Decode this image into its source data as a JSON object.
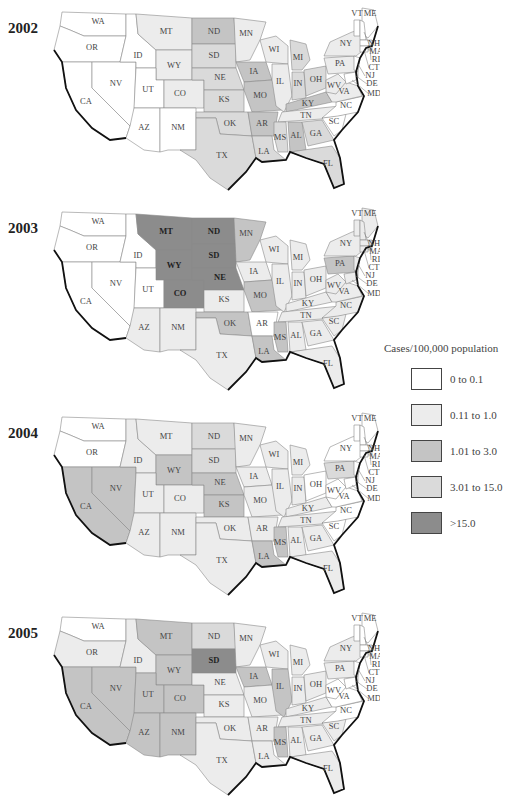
{
  "legend": {
    "title": "Cases/100,000 population",
    "items": [
      {
        "label": "0 to 0.1",
        "color": "#ffffff"
      },
      {
        "label": "0.11 to 1.0",
        "color": "#ececec"
      },
      {
        "label": "1.01  to 3.0",
        "color": "#c4c4c4"
      },
      {
        "label": "3.01 to 15.0",
        "color": "#dadada"
      },
      {
        "label": ">15.0",
        "color": "#8c8c8c"
      }
    ]
  },
  "chart_data": {
    "type": "choropleth",
    "title": "",
    "measure": "Cases/100,000 population",
    "categories": [
      "0 to 0.1",
      "0.11 to 1.0",
      "1.01 to 3.0",
      "3.01 to 15.0",
      ">15.0"
    ],
    "years": [
      {
        "year": "2002",
        "states": {
          "WA": 0,
          "OR": 0,
          "CA": 0,
          "NV": 0,
          "ID": 0,
          "UT": 0,
          "AZ": 0,
          "NM": 0,
          "MT": 1,
          "WY": 1,
          "CO": 1,
          "ND": 2,
          "SD": 3,
          "NE": 3,
          "KS": 3,
          "OK": 3,
          "TX": 3,
          "MN": 1,
          "IA": 2,
          "MO": 2,
          "AR": 2,
          "LA": 3,
          "WI": 1,
          "IL": 1,
          "MI": 3,
          "IN": 3,
          "OH": 3,
          "KY": 2,
          "TN": 1,
          "MS": 3,
          "AL": 2,
          "GA": 3,
          "FL": 3,
          "SC": 0,
          "NC": 0,
          "WV": 1,
          "VA": 1,
          "PA": 1,
          "NY": 1,
          "VT": 0,
          "ME": 0,
          "NH": 0,
          "MA": 0,
          "RI": 0,
          "CT": 0,
          "NJ": 0,
          "DE": 0,
          "MD": 0
        }
      },
      {
        "year": "2003",
        "states": {
          "WA": 0,
          "OR": 0,
          "CA": 0,
          "NV": 0,
          "ID": 0,
          "UT": 0,
          "AZ": 1,
          "NM": 1,
          "MT": 4,
          "WY": 4,
          "CO": 4,
          "ND": 4,
          "SD": 4,
          "NE": 4,
          "KS": 1,
          "OK": 2,
          "TX": 1,
          "MN": 2,
          "IA": 1,
          "MO": 2,
          "AR": 0,
          "LA": 2,
          "WI": 1,
          "IL": 1,
          "MI": 1,
          "IN": 1,
          "OH": 1,
          "KY": 1,
          "TN": 1,
          "MS": 2,
          "AL": 1,
          "GA": 1,
          "FL": 1,
          "SC": 1,
          "NC": 1,
          "WV": 1,
          "VA": 1,
          "PA": 2,
          "NY": 1,
          "VT": 1,
          "ME": 1,
          "NH": 1,
          "MA": 1,
          "RI": 1,
          "CT": 1,
          "NJ": 1,
          "DE": 2,
          "MD": 1
        }
      },
      {
        "year": "2004",
        "states": {
          "WA": 0,
          "OR": 0,
          "CA": 2,
          "NV": 2,
          "ID": 1,
          "UT": 1,
          "AZ": 1,
          "NM": 1,
          "MT": 1,
          "WY": 2,
          "CO": 1,
          "ND": 3,
          "SD": 3,
          "NE": 2,
          "KS": 2,
          "OK": 1,
          "TX": 1,
          "MN": 1,
          "IA": 1,
          "MO": 1,
          "AR": 1,
          "LA": 2,
          "WI": 1,
          "IL": 1,
          "MI": 1,
          "IN": 1,
          "OH": 0,
          "KY": 1,
          "TN": 1,
          "MS": 2,
          "AL": 1,
          "GA": 1,
          "FL": 1,
          "SC": 0,
          "NC": 0,
          "WV": 0,
          "VA": 0,
          "PA": 3,
          "NY": 0,
          "VT": 0,
          "ME": 0,
          "NH": 0,
          "MA": 0,
          "RI": 0,
          "CT": 0,
          "NJ": 0,
          "DE": 0,
          "MD": 0
        }
      },
      {
        "year": "2005",
        "states": {
          "WA": 0,
          "OR": 1,
          "CA": 2,
          "NV": 2,
          "ID": 1,
          "UT": 2,
          "AZ": 2,
          "NM": 2,
          "MT": 2,
          "WY": 2,
          "CO": 2,
          "ND": 3,
          "SD": 4,
          "NE": 1,
          "KS": 1,
          "OK": 1,
          "TX": 1,
          "MN": 1,
          "IA": 2,
          "MO": 1,
          "AR": 1,
          "LA": 1,
          "WI": 1,
          "IL": 2,
          "MI": 1,
          "IN": 1,
          "OH": 1,
          "KY": 1,
          "TN": 1,
          "MS": 2,
          "AL": 1,
          "GA": 1,
          "FL": 1,
          "SC": 1,
          "NC": 0,
          "WV": 0,
          "VA": 0,
          "PA": 1,
          "NY": 1,
          "VT": 0,
          "ME": 0,
          "NH": 0,
          "MA": 0,
          "RI": 0,
          "CT": 0,
          "NJ": 0,
          "DE": 0,
          "MD": 0
        }
      }
    ]
  },
  "panels": [
    {
      "year": "2002"
    },
    {
      "year": "2003"
    },
    {
      "year": "2004"
    },
    {
      "year": "2005"
    }
  ]
}
